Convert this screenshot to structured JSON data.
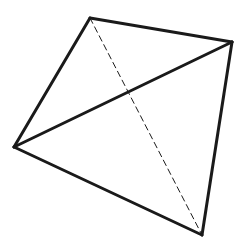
{
  "diagram": {
    "type": "tetrahedron-projection",
    "stroke_color": "#1a1a1a",
    "background": "#ffffff",
    "vertices": {
      "top": [
        90,
        18
      ],
      "right": [
        232,
        42
      ],
      "left": [
        14,
        147
      ],
      "bottom": [
        202,
        235
      ]
    },
    "solid_edges": [
      [
        "top",
        "right"
      ],
      [
        "top",
        "left"
      ],
      [
        "left",
        "right"
      ],
      [
        "left",
        "bottom"
      ],
      [
        "right",
        "bottom"
      ]
    ],
    "hidden_edges": [
      [
        "top",
        "bottom"
      ]
    ]
  }
}
